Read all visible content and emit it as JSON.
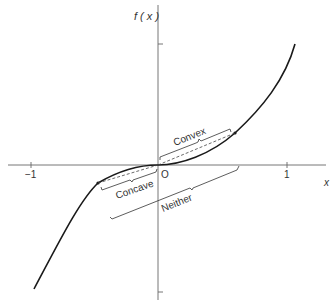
{
  "figure": {
    "y_axis_label": "f ( x )",
    "x_axis_label": "x",
    "origin_label": "O",
    "x_ticks": [
      {
        "label": "−1",
        "value": -1
      },
      {
        "label": "1",
        "value": 1
      }
    ],
    "regions": {
      "convex": "Convex",
      "concave": "Concave",
      "neither": "Neither"
    },
    "colors": {
      "curve": "#1a1a1a",
      "axes": "#555555",
      "background": "#ffffff"
    }
  }
}
